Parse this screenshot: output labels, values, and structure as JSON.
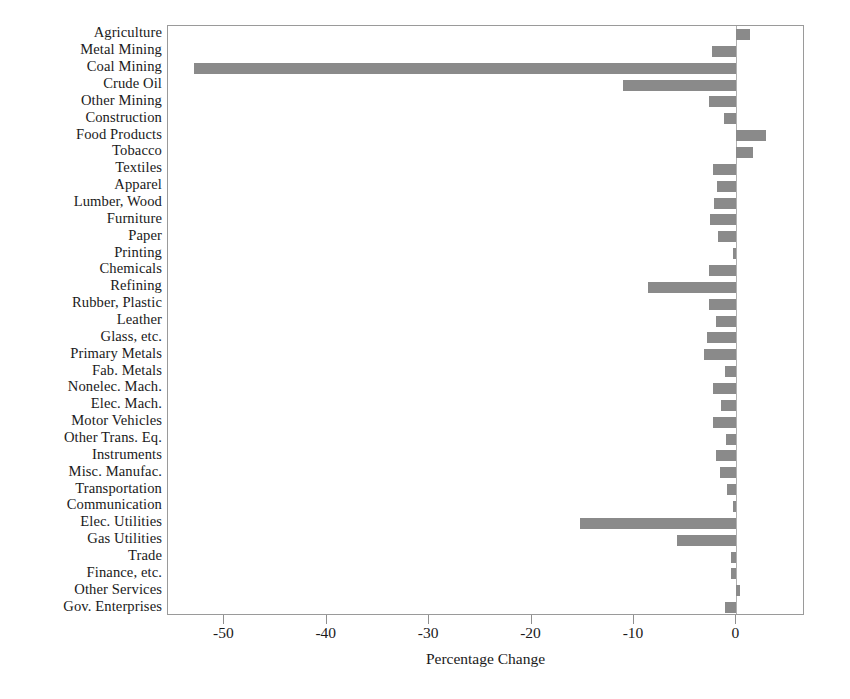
{
  "chart_data": {
    "type": "bar",
    "orientation": "horizontal",
    "title": "",
    "xlabel": "Percentage Change",
    "ylabel": "",
    "xlim": [
      -55.5,
      6.7
    ],
    "xticks": [
      -50,
      -40,
      -30,
      -20,
      -10,
      0
    ],
    "xticklabels": [
      "-50",
      "-40",
      "-30",
      "-20",
      "-10",
      "0"
    ],
    "grid": false,
    "legend": "none",
    "bar_color": "#8a8a8a",
    "frame_color": "#9a9a9a",
    "categories": [
      "Agriculture",
      "Metal Mining",
      "Coal Mining",
      "Crude Oil",
      "Other Mining",
      "Construction",
      "Food Products",
      "Tobacco",
      "Textiles",
      "Apparel",
      "Lumber, Wood",
      "Furniture",
      "Paper",
      "Printing",
      "Chemicals",
      "Refining",
      "Rubber, Plastic",
      "Leather",
      "Glass, etc.",
      "Primary Metals",
      "Fab. Metals",
      "Nonelec. Mach.",
      "Elec. Mach.",
      "Motor Vehicles",
      "Other Trans. Eq.",
      "Instruments",
      "Misc. Manufac.",
      "Transportation",
      "Communication",
      "Elec. Utilities",
      "Gas Utilities",
      "Trade",
      "Finance, etc.",
      "Other Services",
      "Gov. Enterprises"
    ],
    "values": [
      1.3,
      -2.4,
      -53.0,
      -11.1,
      -2.7,
      -1.2,
      2.9,
      1.6,
      -2.3,
      -1.9,
      -2.2,
      -2.6,
      -1.8,
      -0.3,
      -2.7,
      -8.6,
      -2.7,
      -2.0,
      -2.9,
      -3.2,
      -1.1,
      -2.3,
      -1.5,
      -2.3,
      -1.0,
      -2.0,
      -1.6,
      -0.9,
      -0.3,
      -15.3,
      -5.8,
      -0.5,
      -0.5,
      0.4,
      -1.1
    ]
  },
  "axis": {
    "x_title": "Percentage Change"
  }
}
